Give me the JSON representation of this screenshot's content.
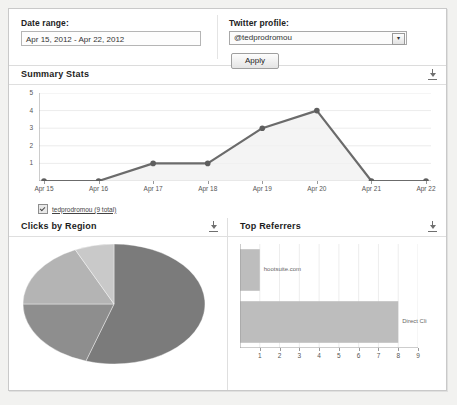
{
  "filters": {
    "date_label": "Date range:",
    "date_value": "Apr 15, 2012 - Apr 22, 2012",
    "profile_label": "Twitter profile:",
    "profile_value": "@tedprodromou",
    "profile_arrow": "▾",
    "apply_label": "Apply"
  },
  "sections": {
    "summary_title": "Summary Stats",
    "region_title": "Clicks by Region",
    "referrers_title": "Top Referrers",
    "download_icon": "download-icon"
  },
  "legend": {
    "label": "tedprodromou (9 total)",
    "checked": true
  },
  "chart_data": [
    {
      "type": "line",
      "title": "Summary Stats",
      "categories": [
        "Apr 15",
        "Apr 16",
        "Apr 17",
        "Apr 18",
        "Apr 19",
        "Apr 20",
        "Apr 21",
        "Apr 22"
      ],
      "values": [
        0,
        0,
        1,
        1,
        3,
        4,
        0,
        0
      ],
      "series_name": "tedprodromou",
      "total": 9,
      "xlabel": "",
      "ylabel": "",
      "ylim": [
        0,
        5
      ],
      "yticks": [
        1,
        2,
        3,
        4,
        5
      ],
      "grid": true,
      "legend_position": "bottom-left",
      "line_color": "#6b6b6b",
      "fill_color": "#f0f0f0",
      "marker_color": "#5e5e5e"
    },
    {
      "type": "pie",
      "title": "Clicks by Region",
      "labels": [
        "",
        "",
        "",
        ""
      ],
      "values": [
        55,
        20,
        18,
        7
      ],
      "colors": [
        "#7b7b7b",
        "#8e8e8e",
        "#b4b4b4",
        "#c9c9c9"
      ],
      "legend_position": "none"
    },
    {
      "type": "bar",
      "title": "Top Referrers",
      "orientation": "horizontal",
      "categories": [
        "hootsuite.com",
        "Direct Cli"
      ],
      "values": [
        1,
        8
      ],
      "xlabel": "",
      "ylabel": "",
      "xlim": [
        0,
        9
      ],
      "xticks": [
        1,
        2,
        3,
        4,
        5,
        6,
        7,
        8,
        9
      ],
      "grid": true,
      "bar_color": "#bdbdbd",
      "legend_position": "none"
    }
  ]
}
